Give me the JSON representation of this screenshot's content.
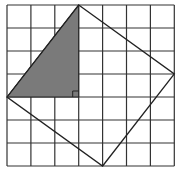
{
  "diagram": {
    "type": "grid-geometry",
    "grid": {
      "cols": 7,
      "rows": 7,
      "x0": 7,
      "y0": 5,
      "cell_w": 23.9,
      "cell_h": 23.0,
      "line_color": "#333333"
    },
    "square": {
      "vertices": [
        [
          3,
          0
        ],
        [
          7,
          3
        ],
        [
          4,
          7
        ],
        [
          0,
          4
        ]
      ],
      "stroke": "#222222"
    },
    "shaded_triangle": {
      "vertices": [
        [
          0,
          4
        ],
        [
          3,
          0
        ],
        [
          3,
          4
        ]
      ],
      "fill": "#7a7a7a"
    },
    "right_angle_marker": {
      "at": [
        3,
        4
      ],
      "size": 6
    }
  }
}
